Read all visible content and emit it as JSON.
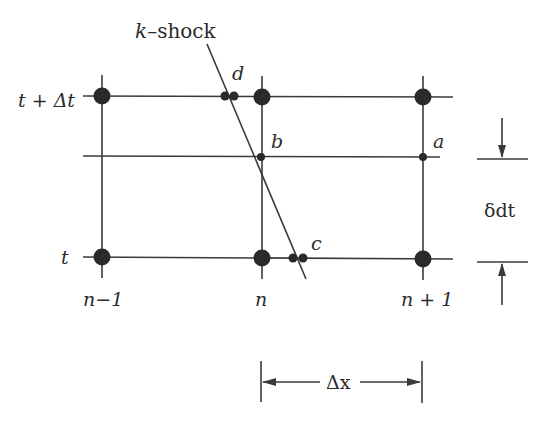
{
  "diagram": {
    "shock_label": "k–shock",
    "time_labels": {
      "top": "t + Δt",
      "bottom": "t"
    },
    "node_labels": {
      "left": "n−1",
      "center": "n",
      "right": "n + 1"
    },
    "point_labels": {
      "a": "a",
      "b": "b",
      "c": "c",
      "d": "d"
    },
    "dimension_labels": {
      "dx": "Δx",
      "ddt": "δdt"
    },
    "colors": {
      "line": "#3a3a3a",
      "node": "#2a2a2a",
      "background": "#ffffff"
    }
  }
}
